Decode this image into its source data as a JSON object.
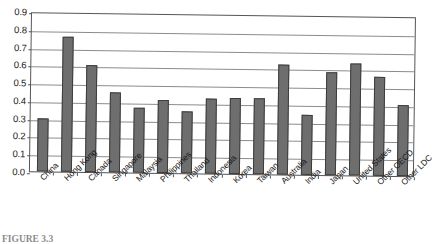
{
  "figure": {
    "caption": "FIGURE 3.3"
  },
  "chart_data": {
    "type": "bar",
    "title": "",
    "xlabel": "",
    "ylabel": "",
    "ylim": [
      0.0,
      0.9
    ],
    "ytick_step": 0.1,
    "grid": true,
    "legend": "none",
    "bar_color": "#6e6e6e",
    "bar_edge_color": "#3d3d3d",
    "categories": [
      "China",
      "Hong Kong",
      "Canada",
      "Singapore",
      "Malaysia",
      "Philippines",
      "Thailand",
      "Indonesia",
      "Korea",
      "Taiwan",
      "Australia",
      "India",
      "Japan",
      "United States",
      "Other OECD",
      "Other LDC"
    ],
    "values": [
      0.3,
      0.76,
      0.6,
      0.45,
      0.365,
      0.41,
      0.35,
      0.42,
      0.43,
      0.43,
      0.62,
      0.34,
      0.58,
      0.63,
      0.555,
      0.4
    ],
    "ytick_labels": [
      "0.0",
      "0.1",
      "0.2",
      "0.3",
      "0.4",
      "0.5",
      "0.6",
      "0.7",
      "0.8",
      "0.9"
    ]
  }
}
